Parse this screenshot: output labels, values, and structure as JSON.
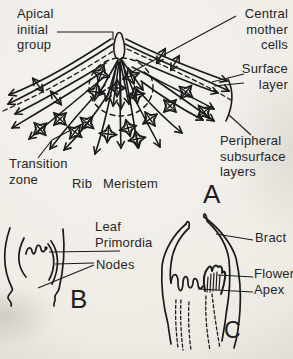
{
  "figure": {
    "panel_a": {
      "letter": "A",
      "labels": {
        "apical_initial_group": "Apical\ninitial\ngroup",
        "central_mother_cells": "Central\nmother\ncells",
        "surface_layer": "Surface\nlayer",
        "peripheral_subsurface_layers": "Peripheral\nsubsurface\nlayers",
        "transition_zone": "Transition\nzone",
        "rib_meristem": "Rib Meristem"
      }
    },
    "panel_b": {
      "letter": "B",
      "labels": {
        "leaf_primordia": "Leaf\nPrimordia",
        "nodes": "Nodes"
      }
    },
    "panel_c": {
      "letter": "C",
      "labels": {
        "bract": "Bract",
        "flower": "Flower",
        "apex": "Apex"
      }
    },
    "colors": {
      "ink": "#1b1b1b",
      "paper": "#f2efe9",
      "label_text": "#262626"
    }
  }
}
